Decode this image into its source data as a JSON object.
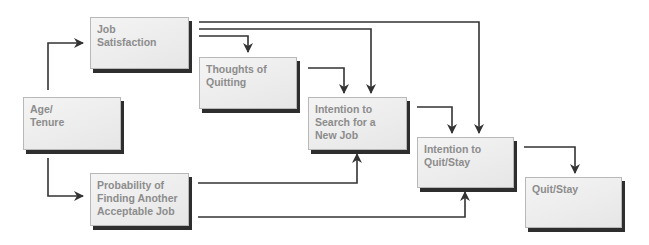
{
  "diagram": {
    "type": "flowchart",
    "colors": {
      "node_fill": "#eeeeee",
      "node_border": "#b8b8b8",
      "node_shadow": "#2e2e2e",
      "node_text": "#8c8c8c",
      "arrow": "#333333"
    },
    "nodes": {
      "age_tenure": {
        "label": "Age/\nTenure"
      },
      "job_satisfaction": {
        "label": "Job\nSatisfaction"
      },
      "thoughts_of_quitting": {
        "label": "Thoughts of\nQuitting"
      },
      "probability_finding_job": {
        "label": "Probability of\nFinding Another\nAcceptable Job"
      },
      "intention_to_search": {
        "label": "Intention to\nSearch for a\nNew Job"
      },
      "intention_to_quit": {
        "label": "Intention to\nQuit/Stay"
      },
      "quit_stay": {
        "label": "Quit/Stay"
      }
    },
    "edges": [
      {
        "from": "age_tenure",
        "to": "job_satisfaction"
      },
      {
        "from": "age_tenure",
        "to": "probability_finding_job"
      },
      {
        "from": "job_satisfaction",
        "to": "thoughts_of_quitting"
      },
      {
        "from": "job_satisfaction",
        "to": "intention_to_search"
      },
      {
        "from": "job_satisfaction",
        "to": "intention_to_quit"
      },
      {
        "from": "thoughts_of_quitting",
        "to": "intention_to_search"
      },
      {
        "from": "probability_finding_job",
        "to": "intention_to_search"
      },
      {
        "from": "probability_finding_job",
        "to": "intention_to_quit"
      },
      {
        "from": "intention_to_search",
        "to": "intention_to_quit"
      },
      {
        "from": "intention_to_quit",
        "to": "quit_stay"
      }
    ]
  }
}
